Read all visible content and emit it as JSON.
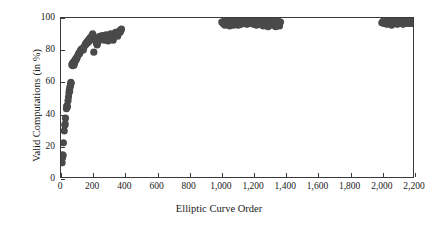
{
  "chart_data": {
    "type": "scatter",
    "title": "",
    "xlabel": "Elliptic Curve Order",
    "ylabel": "Valid Computations (in %)",
    "xlim": [
      0,
      2200
    ],
    "ylim": [
      0,
      100
    ],
    "xticks": [
      0,
      200,
      400,
      600,
      800,
      1000,
      1200,
      1400,
      1600,
      1800,
      2000,
      2200
    ],
    "xtick_labels": [
      "0",
      "200",
      "400",
      "600",
      "800",
      "1,000",
      "1,200",
      "1,400",
      "1,600",
      "1,800",
      "2,000",
      "2,200"
    ],
    "yticks": [
      0,
      20,
      40,
      60,
      80,
      100
    ],
    "ytick_labels": [
      "0",
      "20",
      "40",
      "60",
      "80",
      "100"
    ],
    "grid": false,
    "legend": false,
    "marker_color": "#4a4a4a",
    "marker_size": 3.6,
    "series": [
      {
        "name": "Valid computations",
        "points": [
          [
            7,
            9
          ],
          [
            9,
            12
          ],
          [
            11,
            14
          ],
          [
            13,
            13.5
          ],
          [
            15,
            21.5
          ],
          [
            20,
            29
          ],
          [
            24,
            32.5
          ],
          [
            26,
            33.5
          ],
          [
            28,
            37
          ],
          [
            34,
            43
          ],
          [
            36,
            44.5
          ],
          [
            38,
            45
          ],
          [
            40,
            44
          ],
          [
            44,
            48
          ],
          [
            47,
            50.5
          ],
          [
            50,
            53
          ],
          [
            52,
            54.5
          ],
          [
            54,
            54
          ],
          [
            56,
            56.5
          ],
          [
            58,
            57
          ],
          [
            60,
            58.5
          ],
          [
            62,
            59.5
          ],
          [
            63,
            59
          ],
          [
            68,
            70.5
          ],
          [
            70,
            71
          ],
          [
            72,
            71.5
          ],
          [
            74,
            70
          ],
          [
            76,
            72
          ],
          [
            78,
            71
          ],
          [
            80,
            72.5
          ],
          [
            82,
            70.5
          ],
          [
            84,
            73
          ],
          [
            86,
            72
          ],
          [
            90,
            74
          ],
          [
            93,
            73.5
          ],
          [
            96,
            75
          ],
          [
            99,
            74.5
          ],
          [
            104,
            76
          ],
          [
            108,
            77
          ],
          [
            112,
            78
          ],
          [
            116,
            77.5
          ],
          [
            120,
            79
          ],
          [
            124,
            80
          ],
          [
            128,
            80.5
          ],
          [
            132,
            79.5
          ],
          [
            136,
            81
          ],
          [
            140,
            80
          ],
          [
            143,
            81.5
          ],
          [
            150,
            83
          ],
          [
            154,
            84
          ],
          [
            158,
            83.5
          ],
          [
            162,
            85
          ],
          [
            166,
            84.5
          ],
          [
            170,
            86
          ],
          [
            174,
            85
          ],
          [
            178,
            87
          ],
          [
            182,
            86.5
          ],
          [
            186,
            88
          ],
          [
            190,
            87.5
          ],
          [
            194,
            89
          ],
          [
            198,
            90
          ],
          [
            202,
            89
          ],
          [
            205,
            78.5
          ],
          [
            210,
            87
          ],
          [
            214,
            86
          ],
          [
            218,
            85.5
          ],
          [
            222,
            84
          ],
          [
            226,
            83
          ],
          [
            230,
            84.5
          ],
          [
            234,
            86
          ],
          [
            238,
            87.5
          ],
          [
            242,
            88.5
          ],
          [
            246,
            87
          ],
          [
            250,
            86.5
          ],
          [
            254,
            88
          ],
          [
            258,
            89
          ],
          [
            262,
            88.5
          ],
          [
            266,
            87
          ],
          [
            270,
            86
          ],
          [
            274,
            87.5
          ],
          [
            278,
            88
          ],
          [
            282,
            89.5
          ],
          [
            286,
            88
          ],
          [
            290,
            86.5
          ],
          [
            294,
            85.5
          ],
          [
            298,
            87
          ],
          [
            302,
            88.5
          ],
          [
            306,
            89
          ],
          [
            310,
            90
          ],
          [
            314,
            89.5
          ],
          [
            318,
            88
          ],
          [
            322,
            87
          ],
          [
            326,
            86
          ],
          [
            330,
            88
          ],
          [
            334,
            89.5
          ],
          [
            338,
            90.5
          ],
          [
            342,
            91
          ],
          [
            346,
            90
          ],
          [
            350,
            89
          ],
          [
            354,
            88.5
          ],
          [
            358,
            90
          ],
          [
            362,
            91.5
          ],
          [
            366,
            92
          ],
          [
            370,
            91
          ],
          [
            374,
            92.5
          ],
          [
            378,
            93
          ],
          [
            1005,
            97.5
          ],
          [
            1012,
            96.5
          ],
          [
            1018,
            98
          ],
          [
            1024,
            95.5
          ],
          [
            1030,
            97
          ],
          [
            1036,
            98.5
          ],
          [
            1042,
            96
          ],
          [
            1048,
            97.5
          ],
          [
            1054,
            95
          ],
          [
            1060,
            96.5
          ],
          [
            1066,
            98
          ],
          [
            1072,
            97
          ],
          [
            1078,
            95.5
          ],
          [
            1084,
            96
          ],
          [
            1090,
            97.5
          ],
          [
            1096,
            98.5
          ],
          [
            1102,
            96.5
          ],
          [
            1108,
            95.5
          ],
          [
            1114,
            97
          ],
          [
            1120,
            98
          ],
          [
            1126,
            96
          ],
          [
            1132,
            97.5
          ],
          [
            1138,
            98.5
          ],
          [
            1144,
            96.5
          ],
          [
            1150,
            97
          ],
          [
            1156,
            98
          ],
          [
            1162,
            96
          ],
          [
            1168,
            97.5
          ],
          [
            1174,
            98.5
          ],
          [
            1180,
            97
          ],
          [
            1186,
            96.5
          ],
          [
            1192,
            98
          ],
          [
            1198,
            97.5
          ],
          [
            1204,
            96
          ],
          [
            1210,
            98.5
          ],
          [
            1216,
            97
          ],
          [
            1222,
            95.5
          ],
          [
            1228,
            96.5
          ],
          [
            1234,
            98
          ],
          [
            1240,
            97.5
          ],
          [
            1246,
            96
          ],
          [
            1252,
            98.5
          ],
          [
            1258,
            97
          ],
          [
            1264,
            95
          ],
          [
            1270,
            96.5
          ],
          [
            1276,
            98
          ],
          [
            1282,
            97.5
          ],
          [
            1288,
            96
          ],
          [
            1294,
            94.5
          ],
          [
            1300,
            97
          ],
          [
            1306,
            98.5
          ],
          [
            1312,
            96.5
          ],
          [
            1318,
            95.5
          ],
          [
            1324,
            97.5
          ],
          [
            1330,
            98
          ],
          [
            1336,
            96
          ],
          [
            1342,
            94.5
          ],
          [
            1348,
            97
          ],
          [
            1354,
            98.5
          ],
          [
            1360,
            96.5
          ],
          [
            1366,
            95
          ],
          [
            1372,
            97.5
          ],
          [
            2005,
            97
          ],
          [
            2012,
            98
          ],
          [
            2018,
            96.5
          ],
          [
            2024,
            97.5
          ],
          [
            2030,
            98.5
          ],
          [
            2036,
            96
          ],
          [
            2042,
            97
          ],
          [
            2048,
            98
          ],
          [
            2054,
            96.5
          ],
          [
            2060,
            97.5
          ],
          [
            2066,
            95.5
          ],
          [
            2072,
            98
          ],
          [
            2078,
            97
          ],
          [
            2084,
            96.5
          ],
          [
            2090,
            98.5
          ],
          [
            2096,
            97
          ],
          [
            2102,
            96
          ],
          [
            2108,
            97.5
          ],
          [
            2114,
            98
          ],
          [
            2120,
            96.5
          ],
          [
            2126,
            97
          ],
          [
            2132,
            98.5
          ],
          [
            2138,
            96
          ],
          [
            2144,
            97.5
          ],
          [
            2150,
            98
          ],
          [
            2156,
            96.5
          ],
          [
            2162,
            97
          ],
          [
            2168,
            98
          ],
          [
            2174,
            96.5
          ],
          [
            2180,
            97.5
          ],
          [
            2186,
            98
          ],
          [
            2192,
            96.5
          ],
          [
            2196,
            97
          ]
        ]
      }
    ]
  }
}
